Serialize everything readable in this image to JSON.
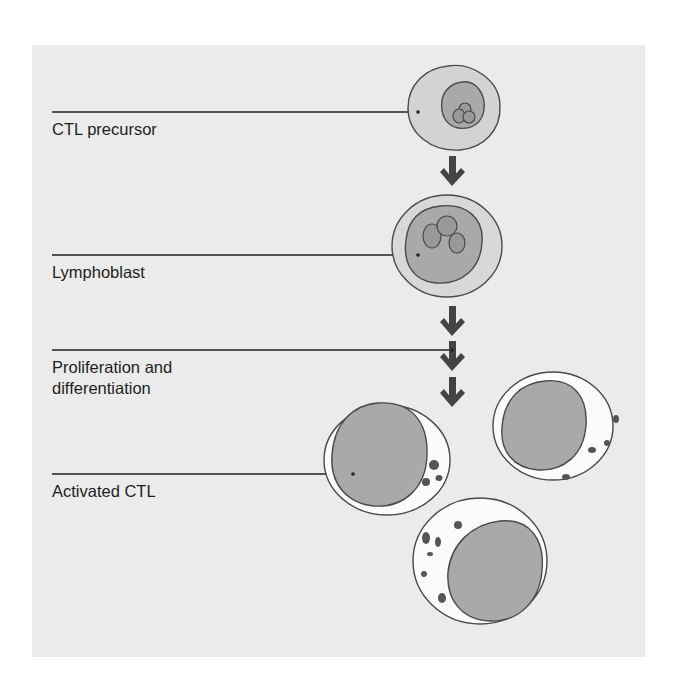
{
  "figure": {
    "type": "cell-differentiation-diagram",
    "colors": {
      "panel_background": "#ebebeb",
      "cytoplasm_precursor": "#d3d3d3",
      "nucleus": "#a9a9a9",
      "nucleolus": "#999999",
      "cytoplasm_activated": "#fbfbfb",
      "outline": "#4a4a4a",
      "arrow": "#444444",
      "leader_line": "#222222",
      "granule": "#555555"
    }
  },
  "labels": [
    {
      "id": "ctl-precursor",
      "text": "CTL precursor"
    },
    {
      "id": "lymphoblast",
      "text": "Lymphoblast"
    },
    {
      "id": "proliferation",
      "line1": "Proliferation and",
      "line2": "differentiation"
    },
    {
      "id": "activated-ctl",
      "text": "Activated CTL"
    }
  ],
  "stages": [
    {
      "name": "CTL precursor",
      "nucleoli": 3,
      "arrows_after": 1
    },
    {
      "name": "Lymphoblast",
      "nucleoli": 3,
      "arrows_after": 3
    },
    {
      "name": "Activated CTL",
      "cell_count": 3,
      "granules": "cytoplasmic granules present"
    }
  ]
}
